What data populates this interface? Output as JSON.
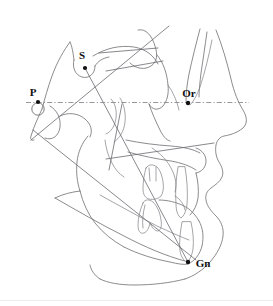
{
  "figure": {
    "name": "cephalometric-tracing",
    "type": "lateral-cephalometric-radiograph-tracing",
    "width": 273,
    "height": 306,
    "background_color": "#ffffff",
    "trace_color": "#6e6e72",
    "landmark_color": "#111111",
    "reference_plane_color": "#8a8a90"
  },
  "landmarks": [
    {
      "id": "porion",
      "label": "P",
      "label_x": 33,
      "label_y": 93,
      "dot_x": 38,
      "dot_y": 102,
      "dot_r": 2.1,
      "has_open_circle": true,
      "circle_cx": 38,
      "circle_cy": 109,
      "circle_r": 6.2
    },
    {
      "id": "sella",
      "label": "S",
      "label_x": 80,
      "label_y": 57,
      "dot_x": 85,
      "dot_y": 68,
      "dot_r": 2.1,
      "has_open_circle": false
    },
    {
      "id": "orbitale",
      "label": "Or",
      "label_x": 182,
      "label_y": 96,
      "dot_x": 188,
      "dot_y": 103,
      "dot_r": 2.2,
      "has_open_circle": false
    },
    {
      "id": "gnathion",
      "label": "Gn",
      "label_x": 192,
      "label_y": 268,
      "dot_x": 188,
      "dot_y": 262,
      "dot_r": 2.2,
      "has_open_circle": false
    }
  ],
  "reference_planes": [
    {
      "id": "frankfort-horizontal",
      "style": "dash-dot",
      "x1": 26,
      "y1": 102.5,
      "x2": 249,
      "y2": 102.5
    }
  ],
  "measurement_lines": [
    {
      "id": "sella-gnathion-line",
      "from": "sella",
      "to": "gnathion",
      "x1": 85,
      "y1": 68,
      "x2": 188,
      "y2": 262
    },
    {
      "id": "mandibular-plane-line",
      "x1": 33,
      "y1": 130,
      "x2": 196,
      "y2": 260
    },
    {
      "id": "upper-facial-line",
      "x1": 31,
      "y1": 140,
      "x2": 169,
      "y2": 26
    },
    {
      "id": "palatal-plane-line",
      "x1": 99,
      "y1": 53,
      "x2": 158,
      "y2": 48
    },
    {
      "id": "occlusal-plane-line",
      "x1": 106,
      "y1": 159,
      "x2": 214,
      "y2": 143
    },
    {
      "id": "ramus-line",
      "x1": 122,
      "y1": 104,
      "x2": 109,
      "y2": 170
    }
  ],
  "anatomical_outlines": [
    "cranial-base",
    "sella-turcica",
    "frontal-bone",
    "nasal-bone",
    "soft-tissue-profile",
    "orbit",
    "maxilla",
    "mandible",
    "upper-incisor",
    "lower-incisor",
    "upper-molar",
    "lower-molar",
    "symphysis",
    "cervical-spine"
  ],
  "footer": {
    "rule_visible": true
  }
}
